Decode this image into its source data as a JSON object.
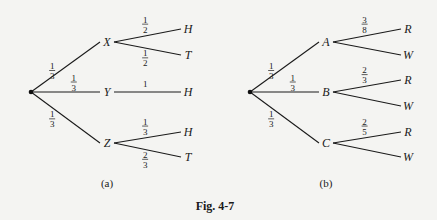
{
  "figure": {
    "caption": "Fig. 4-7",
    "trees": [
      {
        "id": "a",
        "label": "(a)",
        "root": {
          "x": 31,
          "y": 92
        },
        "level1": [
          {
            "name": "X",
            "x": 107,
            "y": 42,
            "prob_num": "1",
            "prob_den": "3",
            "children": [
              {
                "name": "H",
                "x": 188,
                "y": 29,
                "prob_num": "1",
                "prob_den": "2",
                "label_pos": "above"
              },
              {
                "name": "T",
                "x": 188,
                "y": 55,
                "prob_num": "1",
                "prob_den": "2",
                "label_pos": "below"
              }
            ]
          },
          {
            "name": "Y",
            "x": 107,
            "y": 92,
            "prob_num": "1",
            "prob_den": "3",
            "children": [
              {
                "name": "H",
                "x": 188,
                "y": 92,
                "prob_whole": "1",
                "label_pos": "above"
              }
            ]
          },
          {
            "name": "Z",
            "x": 107,
            "y": 143,
            "prob_num": "1",
            "prob_den": "3",
            "children": [
              {
                "name": "H",
                "x": 188,
                "y": 132,
                "prob_num": "1",
                "prob_den": "3",
                "label_pos": "above"
              },
              {
                "name": "T",
                "x": 188,
                "y": 157,
                "prob_num": "2",
                "prob_den": "3",
                "label_pos": "below"
              }
            ]
          }
        ]
      },
      {
        "id": "b",
        "label": "(b)",
        "root": {
          "x": 250,
          "y": 92
        },
        "level1": [
          {
            "name": "A",
            "x": 326,
            "y": 42,
            "prob_num": "1",
            "prob_den": "3",
            "children": [
              {
                "name": "R",
                "x": 408,
                "y": 29,
                "prob_num": "3",
                "prob_den": "8",
                "label_pos": "above"
              },
              {
                "name": "W",
                "x": 408,
                "y": 55
              }
            ]
          },
          {
            "name": "B",
            "x": 326,
            "y": 92,
            "prob_num": "1",
            "prob_den": "3",
            "children": [
              {
                "name": "R",
                "x": 408,
                "y": 80,
                "prob_num": "2",
                "prob_den": "3",
                "label_pos": "above"
              },
              {
                "name": "W",
                "x": 408,
                "y": 106
              }
            ]
          },
          {
            "name": "C",
            "x": 326,
            "y": 143,
            "prob_num": "1",
            "prob_den": "3",
            "children": [
              {
                "name": "R",
                "x": 408,
                "y": 132,
                "prob_num": "2",
                "prob_den": "5",
                "label_pos": "above"
              },
              {
                "name": "W",
                "x": 408,
                "y": 157
              }
            ]
          }
        ]
      }
    ]
  }
}
